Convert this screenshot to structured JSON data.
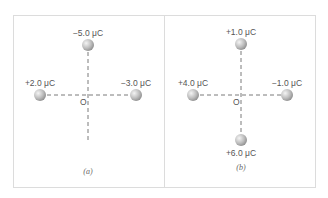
{
  "figure": {
    "panels": [
      {
        "caption": "(a)",
        "origin_label": "O",
        "charges": [
          {
            "position": "top",
            "label": "−5.0 μC"
          },
          {
            "position": "left",
            "label": "+2.0 μC"
          },
          {
            "position": "right",
            "label": "−3.0 μC"
          }
        ]
      },
      {
        "caption": "(b)",
        "origin_label": "O",
        "charges": [
          {
            "position": "top",
            "label": "+1.0 μC"
          },
          {
            "position": "left",
            "label": "+4.0 μC"
          },
          {
            "position": "right",
            "label": "−1.0 μC"
          },
          {
            "position": "bottom",
            "label": "+6.0 μC"
          }
        ]
      }
    ],
    "colors": {
      "border": "#dcdcdc",
      "axis": "#777777",
      "sphere": "#b8b8b8",
      "text": "#555555"
    }
  }
}
